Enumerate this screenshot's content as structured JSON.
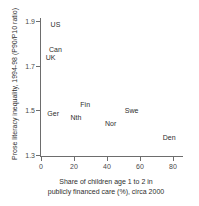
{
  "chart_data": {
    "type": "scatter",
    "title": "",
    "xlabel_lines": [
      "Share of children age 1 to 2 in",
      "publicly financed care (%), circa 2000"
    ],
    "ylabel": "Prose literacy inequality, 1994-98 (P90/P10 ratio)",
    "xlim": [
      -2,
      82
    ],
    "ylim": [
      1.28,
      1.93
    ],
    "xticks": [
      "0",
      "20",
      "40",
      "60",
      "80"
    ],
    "xtick_values": [
      0,
      20,
      40,
      60,
      80
    ],
    "yticks": [
      "1.9",
      "1.7",
      "1.5",
      "1.3"
    ],
    "ytick_values": [
      1.9,
      1.7,
      1.5,
      1.3
    ],
    "grid": false,
    "legend": "none",
    "marker_style": "text-label",
    "points": [
      {
        "label": "US",
        "x": 4,
        "y": 1.885
      },
      {
        "label": "Can",
        "x": 3,
        "y": 1.775
      },
      {
        "label": "UK",
        "x": 1,
        "y": 1.74
      },
      {
        "label": "Ger",
        "x": 2,
        "y": 1.49
      },
      {
        "label": "Fin",
        "x": 22,
        "y": 1.53
      },
      {
        "label": "Nth",
        "x": 16,
        "y": 1.47
      },
      {
        "label": "Swe",
        "x": 49,
        "y": 1.5
      },
      {
        "label": "Nor",
        "x": 37,
        "y": 1.445
      },
      {
        "label": "Den",
        "x": 72,
        "y": 1.38
      }
    ]
  },
  "axis_colors": {
    "axis_line": "#6d6d6d",
    "tick_label": "#4a4a4a",
    "data_label": "#2e2e2e",
    "background": "#ffffff"
  }
}
